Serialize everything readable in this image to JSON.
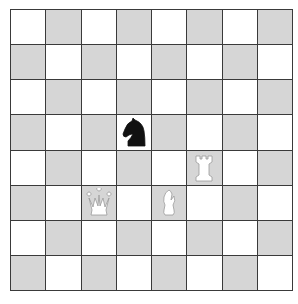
{
  "board": {
    "orientation": "white-bottom",
    "files": [
      "a",
      "b",
      "c",
      "d",
      "e",
      "f",
      "g",
      "h"
    ],
    "ranks": [
      8,
      7,
      6,
      5,
      4,
      3,
      2,
      1
    ],
    "colors": {
      "light": "#ffffff",
      "dark": "#d6d6d6",
      "grid": "#3a3a3a"
    },
    "pieces": [
      {
        "square": "d5",
        "color": "black",
        "type": "knight",
        "glyph": "♞"
      },
      {
        "square": "f4",
        "color": "white",
        "type": "rook",
        "glyph": "♖"
      },
      {
        "square": "c3",
        "color": "white",
        "type": "queen",
        "glyph": "♕"
      },
      {
        "square": "e3",
        "color": "white",
        "type": "bishop",
        "glyph": "♗"
      }
    ]
  }
}
